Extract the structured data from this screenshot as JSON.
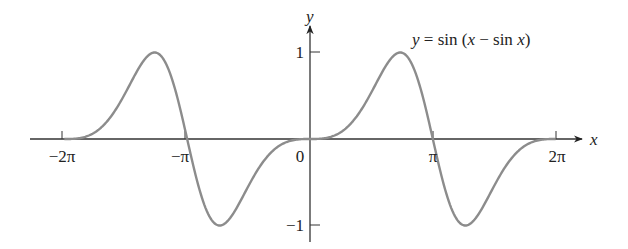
{
  "chart_data": {
    "type": "line",
    "title": "y = sin (x − sin x)",
    "xlabel": "x",
    "ylabel": "y",
    "xlim": [
      -6.2832,
      6.2832
    ],
    "ylim": [
      -1,
      1
    ],
    "grid": false,
    "legend": null,
    "x_ticks": [
      {
        "value": -6.2832,
        "label": "−2π"
      },
      {
        "value": -3.1416,
        "label": "−π"
      },
      {
        "value": 0,
        "label": "0"
      },
      {
        "value": 3.1416,
        "label": "π"
      },
      {
        "value": 6.2832,
        "label": "2π"
      }
    ],
    "y_ticks": [
      {
        "value": 1,
        "label": "1"
      },
      {
        "value": -1,
        "label": "−1"
      }
    ],
    "series": [
      {
        "name": "y = sin (x − sin x)",
        "color": "#8c8c8c",
        "function": "sin(x - sin(x))",
        "x": [
          -6.2832,
          -5.4978,
          -4.7124,
          -4.0387,
          -3.927,
          -3.1416,
          -2.3562,
          -2.2445,
          -1.5708,
          -0.7854,
          0,
          0.7854,
          1.5708,
          2.2445,
          2.3562,
          3.1416,
          3.927,
          4.0387,
          4.7124,
          5.4978,
          6.2832
        ],
        "y": [
          0,
          0.0887,
          0.5403,
          1.0,
          0.9939,
          0,
          -0.9939,
          -1.0,
          -0.5403,
          -0.0887,
          0,
          0.0887,
          0.5403,
          1.0,
          0.9939,
          0,
          -0.9939,
          -1.0,
          -0.5403,
          -0.0887,
          0
        ]
      }
    ],
    "annotation": {
      "text": "y = sin (x − sin x)",
      "position": "upper right"
    }
  },
  "labels": {
    "equation_y": "y",
    "equation_eq": " = sin (",
    "equation_x1": "x",
    "equation_minus": " − sin ",
    "equation_x2": "x",
    "equation_close": ")",
    "x_axis": "x",
    "y_axis": "y",
    "tick_neg2pi": "−2π",
    "tick_negpi": "−π",
    "tick_zero": "0",
    "tick_pi": "π",
    "tick_2pi": "2π",
    "tick_y1": "1",
    "tick_yneg1": "−1"
  },
  "layout": {
    "origin_x": 310,
    "origin_y": 139,
    "px_per_unit_x": 39.1,
    "px_per_unit_y": 86.5,
    "curve_color": "#8c8c8c",
    "axis_color": "#333333"
  }
}
